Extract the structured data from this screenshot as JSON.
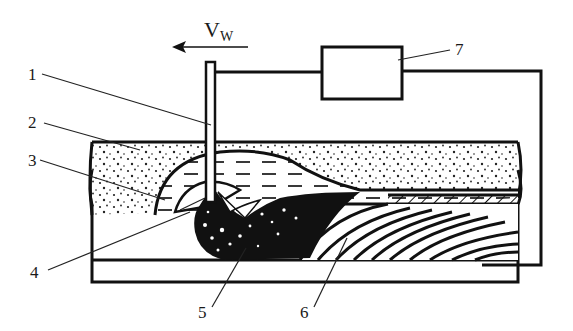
{
  "diagram": {
    "velocity": {
      "symbol": "V",
      "subscript": "W",
      "direction": "left"
    },
    "labels": [
      {
        "id": "1",
        "text": "1",
        "part": "electrode wire"
      },
      {
        "id": "2",
        "text": "2",
        "part": "flux layer"
      },
      {
        "id": "3",
        "text": "3",
        "part": "molten slag"
      },
      {
        "id": "4",
        "text": "4",
        "part": "arc cavity"
      },
      {
        "id": "5",
        "text": "5",
        "part": "weld pool"
      },
      {
        "id": "6",
        "text": "6",
        "part": "solidified weld metal"
      },
      {
        "id": "7",
        "text": "7",
        "part": "power source"
      }
    ],
    "colors": {
      "line": "#111111",
      "background": "#ffffff"
    }
  }
}
